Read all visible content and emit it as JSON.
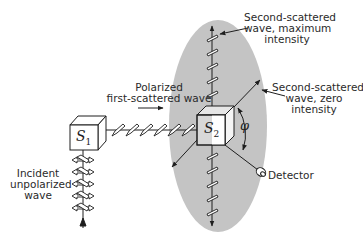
{
  "diagram": {
    "type": "physics-illustration",
    "colors": {
      "ellipse_fill": "#c4c4c4",
      "line": "#1e1e1e",
      "background": "#ffffff"
    },
    "scatterers": [
      {
        "id": "S1",
        "symbol": "S",
        "subscript": "1"
      },
      {
        "id": "S2",
        "symbol": "S",
        "subscript": "2"
      }
    ],
    "angle_symbol": "φ",
    "labels": {
      "incident": [
        "Incident",
        "unpolarized",
        "wave"
      ],
      "polarized": [
        "Polarized",
        "first-scattered wave"
      ],
      "max_intensity": [
        "Second-scattered",
        "wave, maximum",
        "intensity"
      ],
      "zero_intensity": [
        "Second-scattered",
        "wave, zero",
        "intensity"
      ],
      "detector": "Detector"
    }
  }
}
